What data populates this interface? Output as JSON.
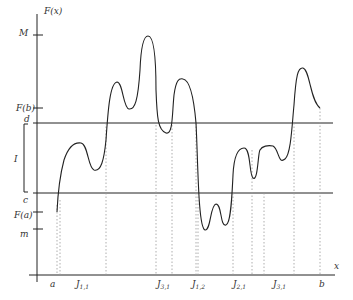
{
  "figure": {
    "y_axis_label": "F(x)",
    "x_axis_label": "x",
    "y_ticks": {
      "M": "M",
      "Fb": "F(b)",
      "d": "d",
      "I": "I",
      "c": "c",
      "Fa": "F(a)",
      "m": "m"
    },
    "x_ticks": {
      "a": "a",
      "J11": "J",
      "J11_sub": "1,1",
      "J31a": "J",
      "J31a_sub": "3,1",
      "J12": "J",
      "J12_sub": "1,2",
      "J21": "J",
      "J21_sub": "2,1",
      "J31b": "J",
      "J31b_sub": "3,1",
      "b": "b"
    }
  }
}
